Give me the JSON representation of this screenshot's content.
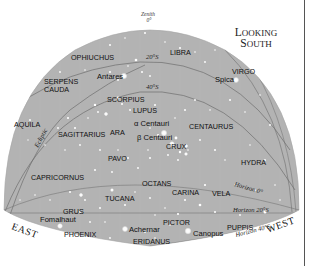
{
  "title": {
    "line1_cap": "L",
    "line1_rest": "OOKING",
    "line2_cap": "S",
    "line2_rest": "OUTH"
  },
  "zenith": {
    "label": "Zenith",
    "value": "0°"
  },
  "declination_labels": [
    {
      "text": "20°S",
      "x": 146,
      "y": 60
    },
    {
      "text": "40°S",
      "x": 146,
      "y": 90
    }
  ],
  "ecliptic_label": "Ecliptic",
  "directions": {
    "east": "EAST",
    "west": "WEST"
  },
  "horizon_labels": {
    "h0": "Horizon 0°",
    "h20": "Horizon 20°S",
    "h40": "Horizon 40°S"
  },
  "constellations": [
    {
      "name": "OPHIUCHUS",
      "x": 71,
      "y": 60
    },
    {
      "name": "LIBRA",
      "x": 170,
      "y": 55
    },
    {
      "name": "VIRGO",
      "x": 232,
      "y": 74
    },
    {
      "name": "SERPENS",
      "x": 44,
      "y": 84
    },
    {
      "name": "CAUDA",
      "x": 44,
      "y": 92
    },
    {
      "name": "SCORPIUS",
      "x": 107,
      "y": 102
    },
    {
      "name": "LUPUS",
      "x": 133,
      "y": 113
    },
    {
      "name": "AQUILA",
      "x": 14,
      "y": 127
    },
    {
      "name": "SAGITTARIUS",
      "x": 58,
      "y": 137
    },
    {
      "name": "ARA",
      "x": 110,
      "y": 135
    },
    {
      "name": "CENTAURUS",
      "x": 189,
      "y": 129
    },
    {
      "name": "CRUX",
      "x": 166,
      "y": 149
    },
    {
      "name": "PAVO",
      "x": 108,
      "y": 161
    },
    {
      "name": "HYDRA",
      "x": 241,
      "y": 165
    },
    {
      "name": "CAPRICORNUS",
      "x": 31,
      "y": 180
    },
    {
      "name": "OCTANS",
      "x": 142,
      "y": 186
    },
    {
      "name": "TUCANA",
      "x": 105,
      "y": 201
    },
    {
      "name": "CARINA",
      "x": 172,
      "y": 195
    },
    {
      "name": "VELA",
      "x": 212,
      "y": 196
    },
    {
      "name": "GRUS",
      "x": 63,
      "y": 214
    },
    {
      "name": "PICTOR",
      "x": 163,
      "y": 225
    },
    {
      "name": "PUPPIS",
      "x": 227,
      "y": 230
    },
    {
      "name": "PHOENIX",
      "x": 64,
      "y": 237
    },
    {
      "name": "ERIDANUS",
      "x": 133,
      "y": 244
    }
  ],
  "stars": [
    {
      "name": "Antares",
      "x": 98,
      "y": 76,
      "label_x": 97,
      "label_y": 79,
      "anchor": "start",
      "mag": 3.2
    },
    {
      "name": "Spica",
      "x": 236,
      "y": 80,
      "label_x": 215,
      "label_y": 82,
      "anchor": "start",
      "mag": 3.0
    },
    {
      "name": "α Centauri",
      "x": 163,
      "y": 142,
      "label_x": 134,
      "label_y": 126,
      "anchor": "start",
      "mag": 3.0
    },
    {
      "name": "β Centauri",
      "x": 171,
      "y": 146,
      "label_x": 137,
      "label_y": 140,
      "anchor": "start",
      "mag": 2.6
    },
    {
      "name": "Fomalhaut",
      "x": 60,
      "y": 226,
      "label_x": 40,
      "label_y": 222,
      "anchor": "start",
      "mag": 2.8
    },
    {
      "name": "Achernar",
      "x": 125,
      "y": 229,
      "label_x": 129,
      "label_y": 232,
      "anchor": "start",
      "mag": 3.0
    },
    {
      "name": "Canopus",
      "x": 189,
      "y": 231,
      "label_x": 193,
      "label_y": 236,
      "anchor": "start",
      "mag": 3.2
    }
  ],
  "colors": {
    "sky": "#b3b3b3",
    "sky_edge": "#a9a9a9",
    "grid_line": "#6e6e6e",
    "star": "#ffffff",
    "text": "#111111",
    "background": "#ffffff"
  }
}
